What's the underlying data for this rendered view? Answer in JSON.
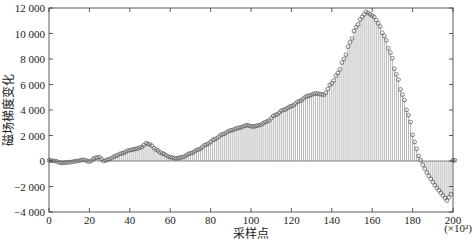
{
  "chart_data": {
    "type": "stem",
    "title": "",
    "xlabel": "采样点",
    "ylabel": "磁场梯度变化",
    "x_multiplier_label": "(×10²)",
    "xlim": [
      0,
      200
    ],
    "ylim": [
      -4000,
      12000
    ],
    "xticks": [
      0,
      20,
      40,
      60,
      80,
      100,
      120,
      140,
      160,
      180,
      200
    ],
    "xtick_labels": [
      "0",
      "20",
      "40",
      "60",
      "80",
      "100",
      "120",
      "140",
      "160",
      "180",
      "200"
    ],
    "yticks": [
      -4000,
      -2000,
      0,
      2000,
      4000,
      6000,
      8000,
      10000,
      12000
    ],
    "ytick_labels": [
      "-4 000",
      "-2 000",
      "0",
      "2 000",
      "4 000",
      "6 000",
      "8 000",
      "10 000",
      "12 000"
    ],
    "grid": false,
    "marker": "circle-open",
    "stem_color": "#9a9a9a",
    "marker_color": "#555555",
    "keypoints": {
      "x": [
        0,
        3,
        6,
        10,
        14,
        17,
        20,
        23,
        25,
        27,
        30,
        33,
        36,
        40,
        43,
        46,
        48,
        50,
        53,
        56,
        60,
        63,
        66,
        70,
        74,
        78,
        82,
        86,
        90,
        94,
        98,
        101,
        104,
        108,
        112,
        116,
        120,
        124,
        128,
        132,
        136,
        140,
        143,
        146,
        149,
        152,
        155,
        157,
        159,
        161,
        163,
        166,
        169,
        172,
        175,
        178,
        181,
        183,
        185,
        187,
        189,
        191,
        193,
        195,
        197,
        199,
        200,
        201
      ],
      "y": [
        50,
        0,
        -150,
        -100,
        0,
        100,
        -50,
        250,
        300,
        0,
        150,
        400,
        600,
        850,
        950,
        1100,
        1400,
        1300,
        900,
        600,
        300,
        200,
        300,
        600,
        900,
        1300,
        1700,
        2100,
        2400,
        2600,
        2800,
        2700,
        2800,
        3100,
        3600,
        4000,
        4300,
        4700,
        5100,
        5300,
        5200,
        6100,
        6900,
        8000,
        9300,
        10500,
        11300,
        11700,
        11500,
        11300,
        10800,
        9800,
        8500,
        6800,
        5200,
        3600,
        1500,
        400,
        -300,
        -900,
        -1400,
        -1900,
        -2300,
        -2700,
        -3100,
        -2600,
        50,
        50
      ]
    },
    "peak": {
      "x": 157,
      "y": 11700
    },
    "trough": {
      "x": 197,
      "y": -3100
    }
  },
  "plot_area": {
    "left": 49,
    "right": 453,
    "top": 8,
    "bottom": 212
  }
}
